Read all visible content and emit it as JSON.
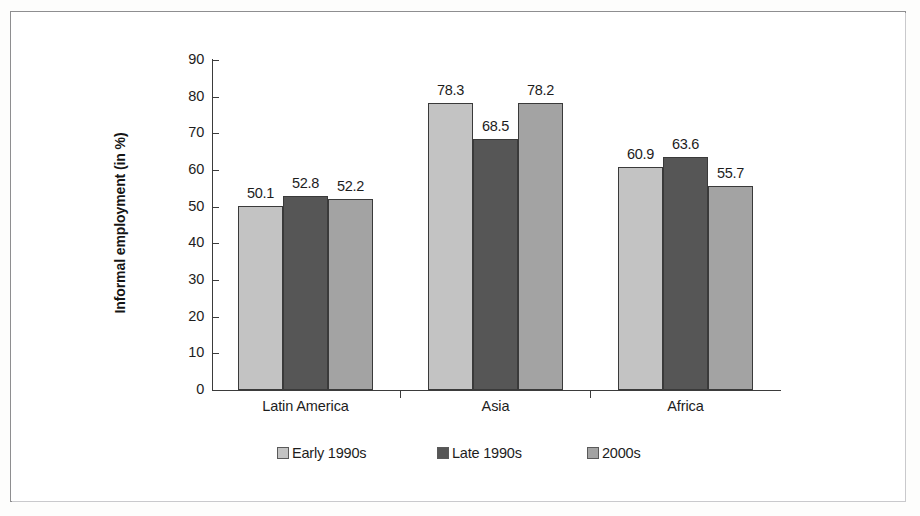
{
  "chart_data": {
    "type": "bar",
    "title": "",
    "subtitle": "",
    "xlabel": "",
    "ylabel": "Informal employment (in %)",
    "categories": [
      "Latin America",
      "Asia",
      "Africa"
    ],
    "series": [
      {
        "name": "Early 1990s",
        "color": "#c3c3c3",
        "values": [
          50.1,
          78.3,
          60.9
        ]
      },
      {
        "name": "Late 1990s",
        "color": "#565656",
        "values": [
          52.8,
          68.5,
          63.6
        ]
      },
      {
        "name": "2000s",
        "color": "#a3a3a3",
        "values": [
          52.2,
          78.2,
          55.7
        ]
      }
    ],
    "data_labels": [
      [
        "50.1",
        "52.8",
        "52.2"
      ],
      [
        "78.3",
        "68.5",
        "78.2"
      ],
      [
        "60.9",
        "63.6",
        "55.7"
      ]
    ],
    "ylim": [
      0,
      90
    ],
    "ytick_values": [
      0,
      10,
      20,
      30,
      40,
      50,
      60,
      70,
      80,
      90
    ],
    "ytick_labels": [
      "0",
      "10",
      "20",
      "30",
      "40",
      "50",
      "60",
      "70",
      "80",
      "90"
    ],
    "grid": false,
    "legend_position": "bottom",
    "legend_labels": [
      "Early 1990s",
      "Late 1990s",
      "2000s"
    ]
  },
  "axis": {
    "y_title": "Informal employment (in %)"
  },
  "legend": {
    "items": [
      {
        "label": "Early 1990s"
      },
      {
        "label": "Late 1990s"
      },
      {
        "label": "2000s"
      }
    ]
  }
}
